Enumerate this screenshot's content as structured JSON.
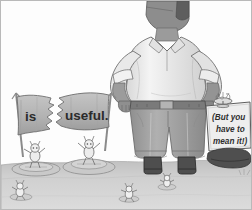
{
  "image": {
    "title": "is useful. (But you have to mean it!)",
    "style": "grayscale cartoon illustration",
    "border_color": "#b9b9b9",
    "background_color": "#fdfdfd"
  },
  "banner": {
    "name": "torn-banner",
    "condition": "torn in half",
    "left_text": "is",
    "right_text": "useful.",
    "cloth_color": "#b5b5b5",
    "pole_color": "#8e8e8e"
  },
  "sign": {
    "name": "protest-sign",
    "line1": "(But you have to mean it!)",
    "text_lines": [
      "(But you",
      "have to",
      "mean it!)"
    ],
    "board_color": "#e8e8e8",
    "post_color": "#9a9a9a"
  },
  "giant": {
    "name": "giant-figure",
    "pose": "hands on hips",
    "shirt_color": "#efefef",
    "pants_color": "#a3a3a3",
    "belt_color": "#6f6f6f",
    "skin_color": "#9b9b9b",
    "shoe_color": "#4a4a4a"
  },
  "creatures": [
    {
      "name": "banner-holder-left",
      "action": "holding left banner pole"
    },
    {
      "name": "banner-holder-right",
      "action": "holding right banner pole, arms raised"
    },
    {
      "name": "sign-top-creature",
      "action": "perched on top of sign"
    },
    {
      "name": "ground-creature-left",
      "action": "standing on ground"
    },
    {
      "name": "ground-creature-center",
      "action": "standing on ground"
    },
    {
      "name": "ground-creature-right",
      "action": "standing on ground"
    }
  ],
  "ground": {
    "name": "ground-plane",
    "sky_color": "#fdfdfd",
    "far_color": "#bdbdbd",
    "near_color": "#d8d8d8",
    "horizon_y": 162
  }
}
